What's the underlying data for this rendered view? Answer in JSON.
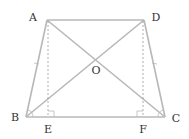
{
  "diagram": {
    "type": "geometry",
    "colors": {
      "line": "#b8b8b8",
      "dashed": "#9a9a9a",
      "text": "#333333"
    },
    "points": {
      "A": {
        "label": "A",
        "x": 47,
        "y": 20
      },
      "D": {
        "label": "D",
        "x": 144,
        "y": 20
      },
      "B": {
        "label": "B",
        "x": 26,
        "y": 117
      },
      "C": {
        "label": "C",
        "x": 165,
        "y": 117
      },
      "E": {
        "label": "E",
        "x": 48,
        "y": 117
      },
      "F": {
        "label": "F",
        "x": 143,
        "y": 117
      },
      "O": {
        "label": "O",
        "x": 95.5,
        "y": 60
      }
    },
    "labels": {
      "A": "A",
      "B": "B",
      "C": "C",
      "D": "D",
      "E": "E",
      "F": "F",
      "O": "O"
    },
    "segments": [
      "AD",
      "AB",
      "DC",
      "BC",
      "AC",
      "BD"
    ],
    "dashed_segments": [
      "AE",
      "DF"
    ],
    "right_angles": [
      "AEB",
      "DFC"
    ],
    "equal_angle_marks": [
      "ABC",
      "DCB"
    ],
    "tick_marks": [
      "AB",
      "DC"
    ]
  }
}
